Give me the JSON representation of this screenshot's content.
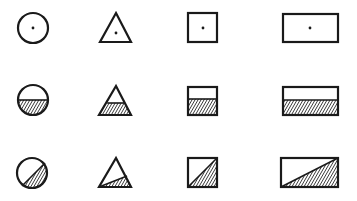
{
  "diagram": {
    "colors": {
      "stroke": "#1a1a1a",
      "background": "#ffffff",
      "hatch": "#1a1a1a"
    },
    "rows": [
      {
        "id": "row-dot",
        "variant": "center-dot",
        "shapes": [
          {
            "type": "circle",
            "cx": 33,
            "cy": 28,
            "r": 15
          },
          {
            "type": "triangle",
            "points": [
              [
                116,
                13
              ],
              [
                131,
                42
              ],
              [
                100,
                42
              ]
            ],
            "dot": [
              116,
              33
            ]
          },
          {
            "type": "square",
            "x": 188,
            "y": 13,
            "w": 29,
            "h": 29
          },
          {
            "type": "rectangle",
            "x": 283,
            "y": 14,
            "w": 55,
            "h": 28
          }
        ]
      },
      {
        "id": "row-half-hatch",
        "variant": "lower-half-hatched",
        "shapes": [
          {
            "type": "circle",
            "cx": 33,
            "cy": 100,
            "r": 15,
            "split_y": 100
          },
          {
            "type": "triangle",
            "points": [
              [
                116,
                86
              ],
              [
                131,
                115
              ],
              [
                99,
                115
              ]
            ],
            "split_y": 103
          },
          {
            "type": "square",
            "x": 188,
            "y": 87,
            "w": 29,
            "h": 28,
            "split_y": 99
          },
          {
            "type": "rectangle",
            "x": 283,
            "y": 87,
            "w": 55,
            "h": 28,
            "split_y": 100
          }
        ]
      },
      {
        "id": "row-diagonal-hatch",
        "variant": "diagonal-hatched",
        "shapes": [
          {
            "type": "circle",
            "cx": 32,
            "cy": 173,
            "r": 15,
            "chord": [
              [
                45,
                163
              ],
              [
                22,
                186
              ]
            ]
          },
          {
            "type": "triangle",
            "points": [
              [
                116,
                158
              ],
              [
                131,
                187
              ],
              [
                99,
                187
              ]
            ],
            "cut_to": [
              127,
              176
            ]
          },
          {
            "type": "square",
            "x": 188,
            "y": 158,
            "w": 29,
            "h": 29
          },
          {
            "type": "rectangle",
            "x": 281,
            "y": 158,
            "w": 57,
            "h": 29
          }
        ]
      }
    ]
  }
}
